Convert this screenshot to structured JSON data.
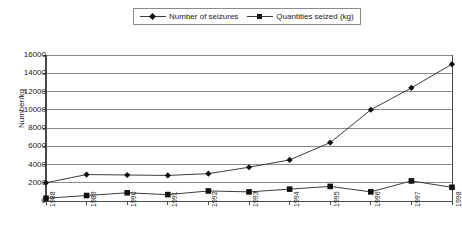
{
  "legend": {
    "position": "top-center",
    "entries": [
      {
        "label": "Number of seizures",
        "marker": "diamond-marker-icon",
        "color": "#111111"
      },
      {
        "label": "Quantities seized (kg)",
        "marker": "square-marker-icon",
        "color": "#111111"
      }
    ]
  },
  "axis": {
    "ylabel": "Number/kg",
    "yticks": [
      "0",
      "2000",
      "4000",
      "6000",
      "8000",
      "10000",
      "12000",
      "14000",
      "16000"
    ],
    "xticks": [
      "1988",
      "1989",
      "1990",
      "1991",
      "1992",
      "1993",
      "1994",
      "1995",
      "1996",
      "1997",
      "1998"
    ]
  },
  "chart_data": {
    "type": "line",
    "title": "",
    "subtitle": "",
    "xlabel": "",
    "ylabel": "Number/kg",
    "ylim": [
      0,
      16000
    ],
    "ytick_step": 2000,
    "grid": true,
    "legend_position": "top-center",
    "categories": [
      "1988",
      "1989",
      "1990",
      "1991",
      "1992",
      "1993",
      "1994",
      "1995",
      "1996",
      "1997",
      "1998"
    ],
    "series": [
      {
        "name": "Number of seizures",
        "marker": "diamond",
        "color": "#111111",
        "values": [
          2000,
          2900,
          2850,
          2800,
          3000,
          3700,
          4500,
          6400,
          10000,
          12400,
          15000
        ]
      },
      {
        "name": "Quantities seized (kg)",
        "marker": "square",
        "color": "#111111",
        "values": [
          300,
          600,
          900,
          700,
          1100,
          1000,
          1300,
          1600,
          1000,
          2200,
          1500
        ]
      }
    ]
  },
  "colors": {
    "line": "#3c3c3c",
    "grid": "#8a8a8a",
    "axis": "#4a4a4a",
    "text": "#1a1a1a",
    "background": "#ffffff"
  }
}
